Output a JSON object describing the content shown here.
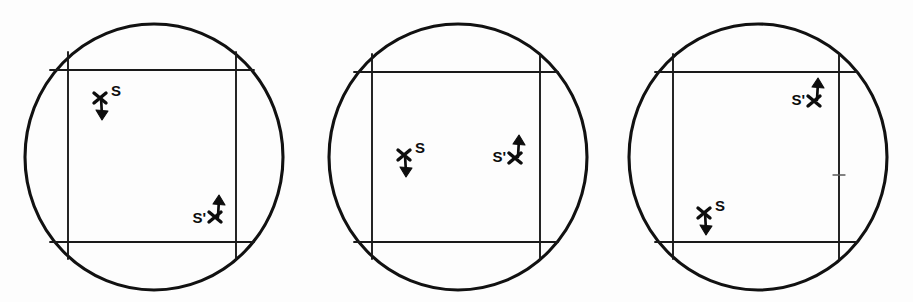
{
  "figure": {
    "background_color": "#fdfdfd",
    "ink_color": "#111111",
    "panel_count": 3,
    "marker_labels": {
      "spin_s": "S",
      "spin_s_prime": "S'"
    }
  },
  "panels": [
    {
      "id": "panel-1",
      "name": "left-circle",
      "circle": {
        "cx": 154,
        "cy": 157,
        "r": 129
      },
      "square": {
        "x1": 68,
        "y1": 70,
        "x2": 236,
        "y2": 242,
        "overhang": 18
      },
      "markers": [
        {
          "name": "spin-marker-s",
          "label": "S",
          "label_side": "right",
          "arrow_direction": "down",
          "x": 100,
          "y": 99
        },
        {
          "name": "spin-marker-s-prime",
          "label": "S'",
          "label_side": "left",
          "arrow_direction": "up",
          "x": 215,
          "y": 215
        }
      ],
      "tick": null
    },
    {
      "id": "panel-2",
      "name": "middle-circle",
      "circle": {
        "cx": 458,
        "cy": 157,
        "r": 129
      },
      "square": {
        "x1": 68,
        "y1": 70,
        "x2": 236,
        "y2": 242,
        "overhang": 18
      },
      "markers": [
        {
          "name": "spin-marker-s",
          "label": "S",
          "label_side": "right",
          "arrow_direction": "down",
          "x": 100,
          "y": 156
        },
        {
          "name": "spin-marker-s-prime",
          "label": "S'",
          "label_side": "left",
          "arrow_direction": "up",
          "x": 211,
          "y": 156
        }
      ],
      "tick": null
    },
    {
      "id": "panel-3",
      "name": "right-circle",
      "circle": {
        "cx": 757,
        "cy": 157,
        "r": 129
      },
      "square": {
        "x1": 68,
        "y1": 70,
        "x2": 232,
        "y2": 242,
        "overhang": 18
      },
      "markers": [
        {
          "name": "spin-marker-s-prime",
          "label": "S'",
          "label_side": "left",
          "arrow_direction": "up",
          "x": 207,
          "y": 99
        },
        {
          "name": "spin-marker-s",
          "label": "S",
          "label_side": "right",
          "arrow_direction": "down",
          "x": 97,
          "y": 214
        }
      ],
      "tick": {
        "x": 229,
        "y": 175,
        "length": 11
      }
    }
  ]
}
